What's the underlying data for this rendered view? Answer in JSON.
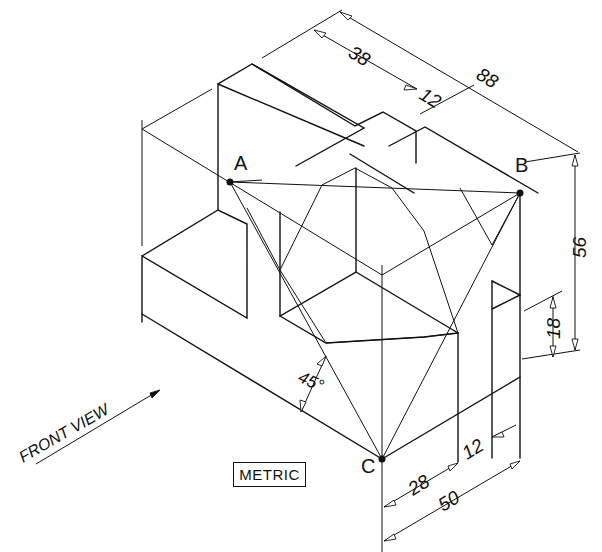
{
  "diagram": {
    "points": [
      {
        "label": "A",
        "x": 230,
        "y": 182
      },
      {
        "label": "B",
        "x": 520,
        "y": 193
      },
      {
        "label": "C",
        "x": 382,
        "y": 459
      }
    ],
    "dimensions": {
      "overall_depth": "88",
      "slot_offset": "38",
      "slot_width_top": "12",
      "height": "56",
      "step_height": "18",
      "angle": "45°",
      "front_28": "28",
      "front_12": "12",
      "front_50": "50"
    },
    "labels": {
      "front_view": "FRONT VIEW",
      "units_badge": "METRIC"
    }
  }
}
